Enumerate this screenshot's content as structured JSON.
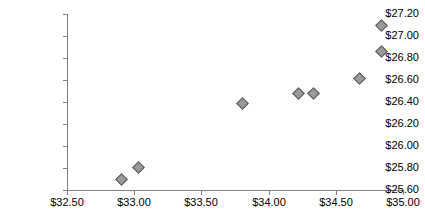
{
  "chart_data": {
    "type": "scatter",
    "title": "",
    "subtitle": "",
    "xlabel": "",
    "ylabel": "",
    "xlim": [
      32.5,
      35.0
    ],
    "ylim": [
      25.6,
      27.2
    ],
    "grid": false,
    "legend": null,
    "marker_style": "diamond",
    "marker_fill": "#9a9a9a",
    "marker_edge": "#555555",
    "axis_color": "#808080",
    "x_tick_labels": [
      "$32.50",
      "$33.00",
      "$33.50",
      "$34.00",
      "$34.50",
      "$35.00"
    ],
    "x_tick_values": [
      32.5,
      33.0,
      33.5,
      34.0,
      34.5,
      35.0
    ],
    "y_tick_labels": [
      "$27.20",
      "$27.00",
      "$26.80",
      "$26.60",
      "$26.40",
      "$26.20",
      "$26.00",
      "$25.80",
      "$25.60"
    ],
    "y_tick_values": [
      27.2,
      27.0,
      26.8,
      26.6,
      26.4,
      26.2,
      26.0,
      25.8,
      25.6
    ],
    "points": [
      {
        "x": 32.9,
        "y": 25.7
      },
      {
        "x": 33.03,
        "y": 25.81
      },
      {
        "x": 33.8,
        "y": 26.39
      },
      {
        "x": 34.22,
        "y": 26.48
      },
      {
        "x": 34.33,
        "y": 26.48
      },
      {
        "x": 34.67,
        "y": 26.62
      },
      {
        "x": 34.84,
        "y": 26.86
      },
      {
        "x": 34.84,
        "y": 27.1
      }
    ]
  }
}
